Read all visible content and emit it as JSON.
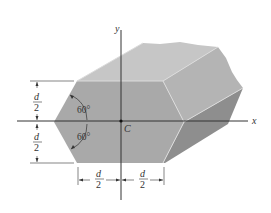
{
  "figure": {
    "axes": {
      "x_label": "x",
      "y_label": "y",
      "origin_label": "C"
    },
    "angles": {
      "upper": "60°",
      "lower": "60°"
    },
    "dimensions": {
      "left_upper": {
        "num": "d",
        "den": "2"
      },
      "left_lower": {
        "num": "d",
        "den": "2"
      },
      "bottom_left": {
        "num": "d",
        "den": "2"
      },
      "bottom_right": {
        "num": "d",
        "den": "2"
      }
    },
    "colors": {
      "front_face": "#a9a9a9",
      "top_face": "#c6c6c6",
      "right_upper_face": "#b4b4b4",
      "right_lower_face": "#8e8e8e",
      "edge": "#e0e0e0",
      "axis": "#333333"
    }
  }
}
